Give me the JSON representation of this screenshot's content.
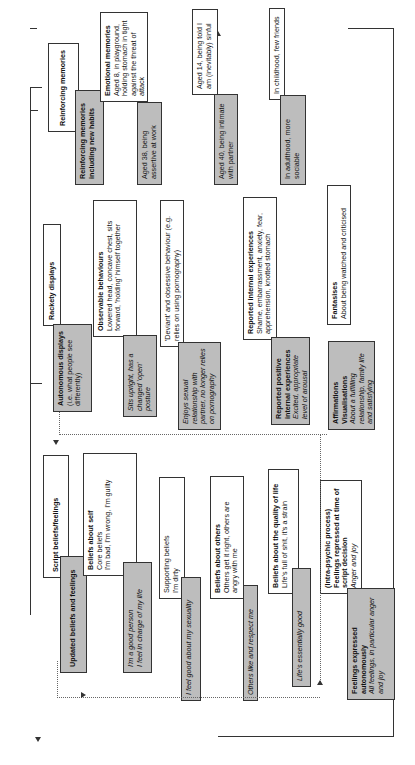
{
  "diagram": {
    "columns": {
      "script": {
        "header": "Script beliefs/feelings",
        "updated_header": "Updated beliefs and feelings",
        "beliefs_self": {
          "title": "Beliefs about self",
          "sub": "Core beliefs",
          "text": "I'm bad, I'm wrong, I'm guilty"
        },
        "beliefs_self_updated": {
          "line1": "I'm a good person",
          "line2": "I feel in charge of my life"
        },
        "supporting": {
          "title": "Supporting beliefs",
          "text": "I'm dirty"
        },
        "supporting_updated": "I feel good about my sexuality",
        "beliefs_others": {
          "title": "Beliefs about others",
          "text": "Others get it right, others are angry with me"
        },
        "beliefs_others_updated": "Others like and respect me",
        "quality_life": {
          "title": "Beliefs about the quality of life",
          "text": "Life's full of shit, it's a strain"
        },
        "quality_life_updated": "Life's essentially good",
        "intrapsychic": {
          "title1": "(Intra-psychic process)",
          "title2": "Feelings repressed at time of script decision",
          "text": "Anger and joy"
        },
        "feelings_expressed": {
          "title": "Feelings expressed autonomously",
          "text": "All feelings, in particular anger and joy"
        }
      },
      "racket": {
        "header": "Rackety displays",
        "autonomous": {
          "title": "Autonomous displays",
          "text": "(i.e. what people see differently)"
        },
        "observable": {
          "title": "Observable behaviours",
          "text": "Lowered head, concave chest, sits forward, 'holding' himself together"
        },
        "observable_updated": "Sits upright, has a changed 'open' posture",
        "deviant": {
          "text": "'Deviant' and obsessive behaviour (e.g. relies on using pornography)"
        },
        "deviant_updated": "Enjoys sexual relationship with partner, no longer relies on pornography",
        "internal": {
          "title": "Reported internal experiences",
          "text": "Shame, embarrassment, anxiety, fear, apprehension, knotted stomach"
        },
        "internal_updated": {
          "title": "Reported positive internal experiences",
          "text": "Excited, appropriate level of arousal"
        },
        "fantasies": {
          "title": "Fantasises",
          "text": "About being watched and criticised"
        },
        "affirmations": {
          "title": "Affirmations Visualisations",
          "text": "About a fulfilling relationship, family life and satisfying employment"
        }
      },
      "memories": {
        "header": "Reinforcing memories",
        "updated_header": "Reinforcing memories including new habits",
        "emotional": {
          "title": "Emotional memories",
          "text": "Aged 8, in playground, holding stomach in tight against the threat of attack"
        },
        "emotional_updated": "Aged 38, being assertive at work",
        "aged14": "Aged 14, being told I am (inevitably) sinful",
        "aged40": "Aged 40, being intimate with partner",
        "childhood": "In childhood, few friends",
        "adulthood": "In adulthood, more sociable"
      }
    }
  }
}
